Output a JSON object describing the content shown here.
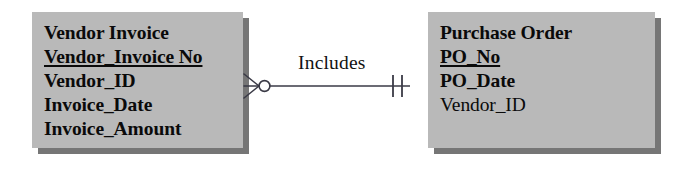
{
  "diagram": {
    "type": "entity-relationship-diagram",
    "notation": "crows-foot",
    "background_color": "#ffffff",
    "entity_fill_color": "#b9b9b9",
    "entity_shadow_color": "#767676",
    "text_color": "#0a0a0a"
  },
  "entities": [
    {
      "id": "vendor-invoice",
      "title": "Vendor Invoice",
      "attributes": [
        {
          "label": "Vendor_Invoice No",
          "key": "primary",
          "style": "bold-underline"
        },
        {
          "label": "Vendor_ID",
          "key": "none",
          "style": "bold"
        },
        {
          "label": "Invoice_Date",
          "key": "none",
          "style": "bold"
        },
        {
          "label": "Invoice_Amount",
          "key": "none",
          "style": "bold"
        }
      ]
    },
    {
      "id": "purchase-order",
      "title": "Purchase Order",
      "attributes": [
        {
          "label": "PO_No",
          "key": "primary",
          "style": "bold-underline"
        },
        {
          "label": "PO_Date",
          "key": "none",
          "style": "bold"
        },
        {
          "label": "Vendor_ID",
          "key": "foreign",
          "style": "regular"
        }
      ]
    }
  ],
  "relationship": {
    "label": "Includes",
    "from_entity": "vendor-invoice",
    "to_entity": "purchase-order",
    "from_cardinality": "zero-or-many",
    "from_symbol": "crows-foot-with-circle",
    "to_cardinality": "one-and-only-one",
    "to_symbol": "double-tick",
    "line_color": "#3a3a46"
  }
}
